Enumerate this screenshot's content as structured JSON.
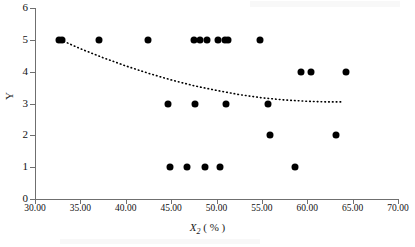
{
  "chart_data": {
    "type": "scatter",
    "title": "",
    "xlabel": "X2 ( % )",
    "xlabel_base": "X",
    "xlabel_sub": "2",
    "xlabel_unit": "( % )",
    "ylabel": "Y",
    "xlim": [
      30.0,
      70.0
    ],
    "ylim": [
      0,
      6
    ],
    "xticks": [
      "30.00",
      "35.00",
      "40.00",
      "45.00",
      "50.00",
      "55.00",
      "60.00",
      "65.00",
      "70.00"
    ],
    "xtick_values": [
      30.0,
      35.0,
      40.0,
      45.0,
      50.0,
      55.0,
      60.0,
      65.0,
      70.0
    ],
    "yticks": [
      "0",
      "1",
      "2",
      "3",
      "4",
      "5",
      "6"
    ],
    "ytick_values": [
      0,
      1,
      2,
      3,
      4,
      5,
      6
    ],
    "grid": false,
    "legend": null,
    "marker": {
      "shape": "circle",
      "color": "#000000",
      "size_px": 7
    },
    "points": [
      {
        "x": 32.6,
        "y": 5
      },
      {
        "x": 33.0,
        "y": 5
      },
      {
        "x": 37.0,
        "y": 5
      },
      {
        "x": 42.4,
        "y": 5
      },
      {
        "x": 47.5,
        "y": 5
      },
      {
        "x": 48.2,
        "y": 5
      },
      {
        "x": 48.9,
        "y": 5
      },
      {
        "x": 50.2,
        "y": 5
      },
      {
        "x": 50.9,
        "y": 5
      },
      {
        "x": 51.3,
        "y": 5
      },
      {
        "x": 54.8,
        "y": 5
      },
      {
        "x": 59.3,
        "y": 4
      },
      {
        "x": 60.4,
        "y": 4
      },
      {
        "x": 64.3,
        "y": 4
      },
      {
        "x": 44.7,
        "y": 3
      },
      {
        "x": 47.6,
        "y": 3
      },
      {
        "x": 51.1,
        "y": 3
      },
      {
        "x": 55.7,
        "y": 3
      },
      {
        "x": 55.9,
        "y": 2
      },
      {
        "x": 63.2,
        "y": 2
      },
      {
        "x": 44.9,
        "y": 1
      },
      {
        "x": 46.7,
        "y": 1
      },
      {
        "x": 48.7,
        "y": 1
      },
      {
        "x": 50.4,
        "y": 1
      },
      {
        "x": 58.6,
        "y": 1
      }
    ],
    "trendline": {
      "style": "dotted",
      "color": "#000000",
      "x_start": 32.8,
      "x_end": 64.0,
      "points": [
        {
          "x": 32.8,
          "y": 5.0
        },
        {
          "x": 35.0,
          "y": 4.72
        },
        {
          "x": 37.5,
          "y": 4.44
        },
        {
          "x": 40.0,
          "y": 4.18
        },
        {
          "x": 42.5,
          "y": 3.95
        },
        {
          "x": 45.0,
          "y": 3.74
        },
        {
          "x": 47.5,
          "y": 3.56
        },
        {
          "x": 50.0,
          "y": 3.41
        },
        {
          "x": 52.5,
          "y": 3.28
        },
        {
          "x": 55.0,
          "y": 3.18
        },
        {
          "x": 57.5,
          "y": 3.11
        },
        {
          "x": 60.0,
          "y": 3.07
        },
        {
          "x": 62.0,
          "y": 3.05
        },
        {
          "x": 64.0,
          "y": 3.05
        }
      ]
    }
  }
}
